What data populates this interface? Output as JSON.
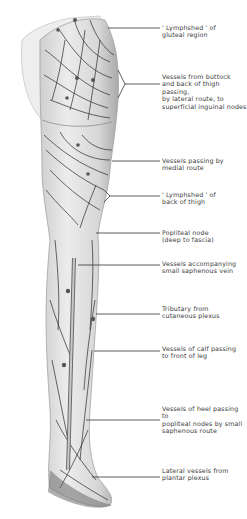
{
  "figure": {
    "colors": {
      "skin": "#e4e4e4",
      "skin_shadow": "#b5b5b5",
      "vessel": "#2a2a2a",
      "leader_line": "#333333",
      "label_text": "#3a3a3a",
      "background": "#ffffff"
    }
  },
  "labels": [
    {
      "text": "' Lymphshed ' of\ngluteal region",
      "top": 24,
      "line_y": 28
    },
    {
      "text": "Vessels from buttock\nand back of thigh passing,\nby lateral route, to\nsuperficial inguinal nodes",
      "top": 73,
      "line_y": 84
    },
    {
      "text": "Vessels passing by\nmedial route",
      "top": 157,
      "line_y": 161
    },
    {
      "text": "' Lymphshed ' of\nback of thigh",
      "top": 191,
      "line_y": 196
    },
    {
      "text": "Popliteal node\n(deep to fascia)",
      "top": 229,
      "line_y": 233
    },
    {
      "text": "Vessels accompanying\nsmall saphenous vein",
      "top": 260,
      "line_y": 265
    },
    {
      "text": "Tributary from\ncutaneous plexus",
      "top": 305,
      "line_y": 314
    },
    {
      "text": "Vessels of calf passing\nto front of leg",
      "top": 345,
      "line_y": 351
    },
    {
      "text": "Vessels of heel passing to\npopliteal nodes by small\nsaphenous route",
      "top": 405,
      "line_y": 420
    },
    {
      "text": "Lateral vessels from\nplantar plexus",
      "top": 467,
      "line_y": 477
    }
  ]
}
